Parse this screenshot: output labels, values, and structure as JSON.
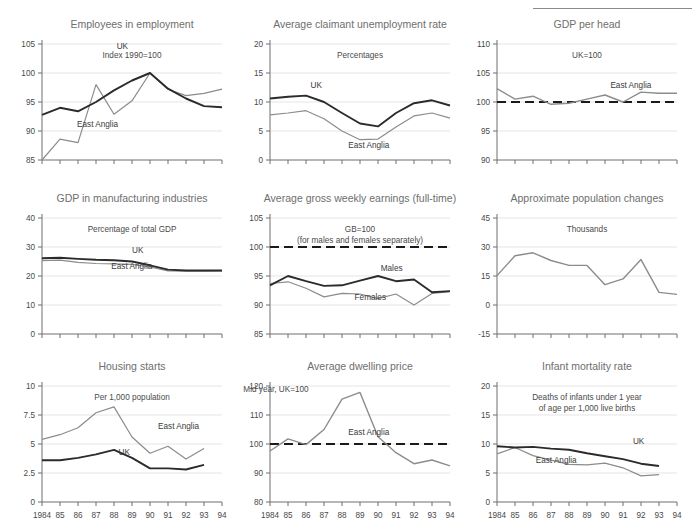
{
  "page": {
    "top_rule": true
  },
  "years": [
    "1984",
    "85",
    "86",
    "87",
    "88",
    "89",
    "90",
    "91",
    "92",
    "93",
    "94"
  ],
  "series_names": {
    "uk": "UK",
    "east_anglia": "East Anglia",
    "males": "Males",
    "females": "Females"
  },
  "colors": {
    "uk_line": "#2b2b2b",
    "east_anglia_line": "#8c8c8c",
    "reference_line": "#1a1a1a",
    "title": "#6e6e6e",
    "axis": "#6e6e6e",
    "grid": "#dedede"
  },
  "chart_data": [
    {
      "id": "employees-in-employment",
      "type": "line",
      "title": "Employees in employment",
      "subtitle": "Index 1990=100",
      "xlabel": "",
      "ylabel": "",
      "x": [
        "1984",
        "85",
        "86",
        "87",
        "88",
        "89",
        "90",
        "91",
        "92",
        "93",
        "94"
      ],
      "ylim": [
        85,
        105
      ],
      "yticks": [
        85,
        90,
        95,
        100,
        105
      ],
      "grid": true,
      "series": [
        {
          "name": "UK",
          "label_pos": "inner",
          "values": [
            92.8,
            94.0,
            93.4,
            95.0,
            97.0,
            98.7,
            100.0,
            97.3,
            95.6,
            94.3,
            94.1
          ]
        },
        {
          "name": "East Anglia",
          "label_pos": "inner",
          "values": [
            85.0,
            88.6,
            88.0,
            98.0,
            92.9,
            95.2,
            100.0,
            97.2,
            96.1,
            96.5,
            97.2
          ]
        }
      ]
    },
    {
      "id": "claimant-unemployment-rate",
      "type": "line",
      "title": "Average claimant unemployment rate",
      "subtitle": "Percentages",
      "x": [
        "1984",
        "85",
        "86",
        "87",
        "88",
        "89",
        "90",
        "91",
        "92",
        "93",
        "94"
      ],
      "ylim": [
        0,
        20
      ],
      "yticks": [
        0,
        5,
        10,
        15,
        20
      ],
      "grid": true,
      "series": [
        {
          "name": "UK",
          "values": [
            10.6,
            10.9,
            11.1,
            10.0,
            8.1,
            6.3,
            5.8,
            8.1,
            9.8,
            10.3,
            9.4
          ]
        },
        {
          "name": "East Anglia",
          "values": [
            7.8,
            8.1,
            8.5,
            7.1,
            5.0,
            3.5,
            3.6,
            5.7,
            7.6,
            8.1,
            7.2
          ]
        }
      ]
    },
    {
      "id": "gdp-per-head",
      "type": "line",
      "title": "GDP per head",
      "subtitle": "UK=100",
      "x": [
        "1984",
        "85",
        "86",
        "87",
        "88",
        "89",
        "90",
        "91",
        "92",
        "93",
        "94"
      ],
      "ylim": [
        90,
        110
      ],
      "yticks": [
        90,
        95,
        100,
        105,
        110
      ],
      "grid": true,
      "reference_line": 100,
      "series": [
        {
          "name": "East Anglia",
          "values": [
            102.3,
            100.5,
            101.0,
            99.6,
            99.8,
            100.5,
            101.2,
            100.0,
            101.7,
            101.5,
            101.5
          ]
        }
      ]
    },
    {
      "id": "gdp-manufacturing",
      "type": "line",
      "title": "GDP in manufacturing industries",
      "subtitle": "Percentage of total GDP",
      "x": [
        "1984",
        "85",
        "86",
        "87",
        "88",
        "89",
        "90",
        "91",
        "92",
        "93",
        "94"
      ],
      "ylim": [
        0,
        40
      ],
      "yticks": [
        0,
        10,
        20,
        30,
        40
      ],
      "grid": true,
      "series": [
        {
          "name": "UK",
          "values": [
            26.1,
            26.3,
            25.9,
            25.6,
            25.4,
            25.0,
            23.7,
            22.2,
            21.9,
            21.9,
            21.9
          ]
        },
        {
          "name": "East Anglia",
          "values": [
            25.3,
            25.5,
            24.7,
            24.3,
            24.2,
            24.0,
            23.1,
            21.8,
            21.7,
            21.7,
            21.8
          ]
        }
      ]
    },
    {
      "id": "average-gross-weekly-earnings",
      "type": "line",
      "title": "Average gross weekly earnings (full-time)",
      "subtitle": "GB=100\n(for males and females separately)",
      "subtitle_line1": "GB=100",
      "subtitle_line2": "(for males and females separately)",
      "x": [
        "1984",
        "85",
        "86",
        "87",
        "88",
        "89",
        "90",
        "91",
        "92",
        "93",
        "94"
      ],
      "ylim": [
        85,
        105
      ],
      "yticks": [
        85,
        90,
        95,
        100,
        105
      ],
      "grid": true,
      "reference_line": 100,
      "series": [
        {
          "name": "Males",
          "values": [
            93.4,
            95.0,
            94.1,
            93.3,
            93.4,
            94.2,
            95.0,
            94.1,
            94.4,
            92.2,
            92.4
          ]
        },
        {
          "name": "Females",
          "values": [
            93.7,
            94.0,
            92.9,
            91.4,
            92.0,
            91.9,
            91.1,
            91.9,
            90.0,
            92.0,
            92.3
          ]
        }
      ]
    },
    {
      "id": "approximate-population-changes",
      "type": "line",
      "title": "Approximate population changes",
      "subtitle": "Thousands",
      "x": [
        "1984",
        "85",
        "86",
        "87",
        "88",
        "89",
        "90",
        "91",
        "92",
        "93",
        "94"
      ],
      "ylim": [
        -15,
        45
      ],
      "yticks": [
        -15,
        0,
        15,
        30,
        45
      ],
      "grid": true,
      "series": [
        {
          "name": "East Anglia",
          "values": [
            15.2,
            25.5,
            27.0,
            23.0,
            20.5,
            20.5,
            10.5,
            13.5,
            23.5,
            6.5,
            5.5
          ]
        }
      ]
    },
    {
      "id": "housing-starts",
      "type": "line",
      "title": "Housing starts",
      "subtitle": "Per 1,000 population",
      "x": [
        "1984",
        "85",
        "86",
        "87",
        "88",
        "89",
        "90",
        "91",
        "92",
        "93",
        "94"
      ],
      "ylim": [
        0,
        10
      ],
      "yticks": [
        0,
        2.5,
        5,
        7.5,
        10
      ],
      "ytick_labels": [
        "0",
        "2.5",
        "5",
        "7.5",
        "10"
      ],
      "grid": true,
      "series": [
        {
          "name": "UK",
          "values": [
            3.6,
            3.6,
            3.8,
            4.1,
            4.5,
            3.8,
            2.9,
            2.9,
            2.8,
            3.2,
            null
          ]
        },
        {
          "name": "East Anglia",
          "values": [
            5.4,
            5.8,
            6.4,
            7.7,
            8.2,
            5.6,
            4.2,
            4.8,
            3.7,
            4.6,
            null
          ]
        }
      ]
    },
    {
      "id": "average-dwelling-price",
      "type": "line",
      "title": "Average dwelling price",
      "subtitle": "Mid year, UK=100",
      "x": [
        "1984",
        "85",
        "86",
        "87",
        "88",
        "89",
        "90",
        "91",
        "92",
        "93",
        "94"
      ],
      "ylim": [
        80,
        120
      ],
      "yticks": [
        80,
        90,
        100,
        110,
        120
      ],
      "grid": true,
      "reference_line": 100,
      "series": [
        {
          "name": "East Anglia",
          "values": [
            97.6,
            101.8,
            99.8,
            105.0,
            115.5,
            117.8,
            102.5,
            97.0,
            93.2,
            94.5,
            92.5
          ]
        }
      ]
    },
    {
      "id": "infant-mortality-rate",
      "type": "line",
      "title": "Infant mortality rate",
      "subtitle_line1": "Deaths of infants under 1 year",
      "subtitle_line2": "of age per 1,000 live births",
      "x": [
        "1984",
        "85",
        "86",
        "87",
        "88",
        "89",
        "90",
        "91",
        "92",
        "93",
        "94"
      ],
      "ylim": [
        0,
        20
      ],
      "yticks": [
        0,
        5,
        10,
        15,
        20
      ],
      "grid": true,
      "series": [
        {
          "name": "UK",
          "values": [
            9.6,
            9.4,
            9.5,
            9.2,
            9.0,
            8.4,
            7.9,
            7.4,
            6.6,
            6.2,
            null
          ]
        },
        {
          "name": "East Anglia",
          "values": [
            8.3,
            9.4,
            8.0,
            7.2,
            6.5,
            6.4,
            6.7,
            5.9,
            4.5,
            4.7,
            null
          ]
        }
      ]
    }
  ]
}
